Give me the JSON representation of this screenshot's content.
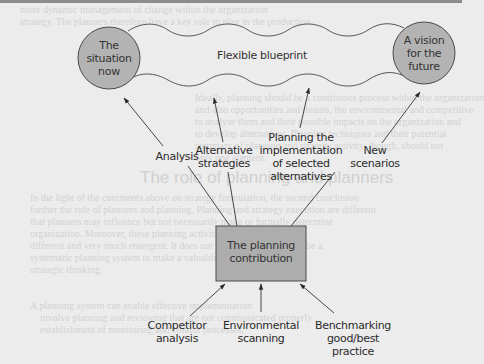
{
  "diagram": {
    "nodes": {
      "current_state": "The situation now",
      "future_state": "A vision for the future",
      "band": "Flexible blueprint",
      "center_box": "The planning contribution"
    },
    "outputs": [
      {
        "line1": "Analysis",
        "line2": ""
      },
      {
        "line1": "Alternative",
        "line2": "strategies"
      },
      {
        "line1": "Planning the",
        "line2": "implementation",
        "line3": "of selected",
        "line4": "alternatives"
      },
      {
        "line1": "New",
        "line2": "scenarios"
      }
    ],
    "inputs": [
      {
        "line1": "Competitor",
        "line2": "analysis"
      },
      {
        "line1": "Environmental",
        "line2": "scanning"
      },
      {
        "line1": "Benchmarking",
        "line2": "good/best",
        "line3": "practice"
      }
    ],
    "colors": {
      "background": "#ececec",
      "node_fill": "#b3b3b3",
      "box_fill": "#adadad",
      "stroke": "#4a4a4a",
      "text": "#2a2a2a"
    }
  },
  "background_text": {
    "heading": "The role of planning and planners",
    "lines": [
      "more dynamic management of change within the organization",
      "strategy. The planners therefore have a key role to play in the production",
      "Ideally, planning should be a continuous process within the organization",
      "and also opportunities and threats, the environmental and competitive",
      "to analyse them and their possible impacts on the organization and",
      "to develop alternatives. Planning techniques and their potential",
      "summary of planning and strategy activity, though, should not",
      "only one element.",
      "In the light of the comments above on strategy formulation, the second conclusion",
      "further the role of planners and planning. Planning and strategy execution are different",
      "that planners may influence but not necessarily make or formally determine",
      "organization. Moreover, these planning activities are likely to be",
      "different and very much emergent. It does not follow that there must be a",
      "systematic planning system to make a valuable contribution to the",
      "strategic thinking.",
      "A planning system can enable effective implementation",
      "involve planning and reviewing that are not communicated properly",
      "establishment of monitoring and control processes."
    ]
  }
}
